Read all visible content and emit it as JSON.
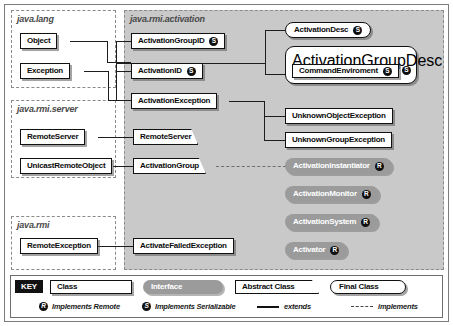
{
  "diagram": {
    "packages": [
      {
        "name": "java.lang"
      },
      {
        "name": "java.rmi.activation"
      },
      {
        "name": "java.rmi.server"
      },
      {
        "name": "java.rmi"
      }
    ]
  },
  "nodes": {
    "object": {
      "label": "Object",
      "kind": "class"
    },
    "exception": {
      "label": "Exception",
      "kind": "class"
    },
    "remote_server_pkg": {
      "label": "RemoteServer",
      "kind": "class"
    },
    "unicast_remote_object": {
      "label": "UnicastRemoteObject",
      "kind": "class"
    },
    "remote_exception": {
      "label": "RemoteException",
      "kind": "class"
    },
    "activation_group_id": {
      "label": "ActivationGroupID",
      "kind": "class",
      "badge": "S"
    },
    "activation_id": {
      "label": "ActivationID",
      "kind": "class",
      "badge": "S"
    },
    "activation_exception": {
      "label": "ActivationException",
      "kind": "class"
    },
    "remote_server_abs": {
      "label": "RemoteServer",
      "kind": "abstract"
    },
    "activation_group": {
      "label": "ActivationGroup",
      "kind": "abstract"
    },
    "activate_failed_exception": {
      "label": "ActivateFailedException",
      "kind": "class"
    },
    "activation_desc": {
      "label": "ActivationDesc",
      "kind": "final",
      "badge": "S"
    },
    "activation_group_desc": {
      "label": "ActivationGroupDesc",
      "kind": "final",
      "badge": "S"
    },
    "command_environment": {
      "label": "CommandEnviroment",
      "kind": "class",
      "badge": "S"
    },
    "unknown_object_exception": {
      "label": "UnknownObjectException",
      "kind": "class"
    },
    "unknown_group_exception": {
      "label": "UnknownGroupException",
      "kind": "class"
    },
    "activation_instantiator": {
      "label": "ActivationInstantiator",
      "kind": "interface",
      "badge": "R"
    },
    "activation_monitor": {
      "label": "ActivationMonitor",
      "kind": "interface",
      "badge": "R"
    },
    "activation_system": {
      "label": "ActivationSystem",
      "kind": "interface",
      "badge": "R"
    },
    "activator": {
      "label": "Activator",
      "kind": "interface",
      "badge": "R"
    }
  },
  "legend": {
    "key_label": "KEY",
    "swatches": [
      {
        "label": "Class",
        "kind": "class"
      },
      {
        "label": "Interface",
        "kind": "interface"
      },
      {
        "label": "Abstract Class",
        "kind": "abstract"
      },
      {
        "label": "Final Class",
        "kind": "final"
      }
    ],
    "notes": [
      {
        "badge": "R",
        "text": "Implements Remote"
      },
      {
        "badge": "S",
        "text": "Implements Serializable"
      },
      {
        "line": "solid",
        "text": "extends"
      },
      {
        "line": "dashed",
        "text": "implements"
      }
    ]
  },
  "colors": {
    "package_shade": "#c9c9c9",
    "interface_fill": "#9b9b9b",
    "line": "#1d1d1d",
    "badge": "#101010"
  }
}
